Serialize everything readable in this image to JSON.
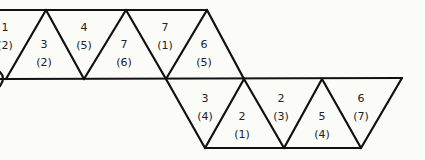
{
  "diagram": {
    "top_row": [
      {
        "id": "t0",
        "top": "1",
        "bottom": "(2)",
        "orientation": "down",
        "partial": true
      },
      {
        "id": "t1",
        "top": "3",
        "bottom": "(2)",
        "orientation": "up"
      },
      {
        "id": "t2",
        "top": "4",
        "bottom": "(5)",
        "orientation": "down"
      },
      {
        "id": "t3",
        "top": "7",
        "bottom": "(6)",
        "orientation": "up"
      },
      {
        "id": "t4",
        "top": "7",
        "bottom": "(1)",
        "orientation": "down"
      },
      {
        "id": "t5",
        "top": "6",
        "bottom": "(5)",
        "orientation": "up"
      }
    ],
    "bottom_row": [
      {
        "id": "b0",
        "top": "3",
        "bottom": "(4)",
        "orientation": "down"
      },
      {
        "id": "b1",
        "top": "2",
        "bottom": "(1)",
        "orientation": "up"
      },
      {
        "id": "b2",
        "top": "2",
        "bottom": "(3)",
        "orientation": "down"
      },
      {
        "id": "b3",
        "top": "5",
        "bottom": "(4)",
        "orientation": "up"
      },
      {
        "id": "b4",
        "top": "6",
        "bottom": "(7)",
        "orientation": "down"
      }
    ]
  }
}
